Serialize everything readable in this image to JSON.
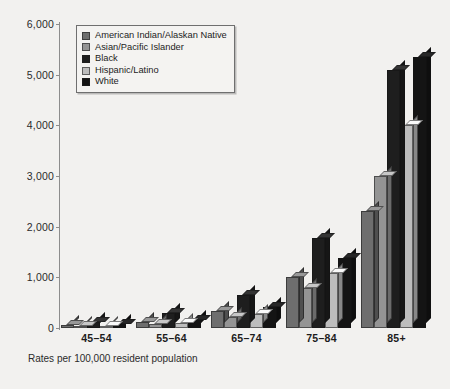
{
  "figure": {
    "background_color": "#f2f1ef",
    "footnote": "Rates per 100,000 resident population"
  },
  "legend": {
    "position": "top-left-inside",
    "entries": [
      {
        "label": "American Indian/Alaskan Native",
        "color": "#6e6e6e"
      },
      {
        "label": "Asian/Pacific Islander",
        "color": "#949494"
      },
      {
        "label": "Black",
        "color": "#1e1e1e"
      },
      {
        "label": "Hispanic/Latino",
        "color": "#bdbdbd"
      },
      {
        "label": "White",
        "color": "#141414"
      }
    ]
  },
  "axes": {
    "y_ticks": [
      "6,000",
      "5,000",
      "4,000",
      "3,000",
      "2,000",
      "1,000",
      "0"
    ],
    "x_labels": [
      "45–54",
      "55–64",
      "65–74",
      "75–84",
      "85+"
    ]
  },
  "chart_data": {
    "type": "bar",
    "title": "",
    "subtitle": "",
    "xlabel": "",
    "ylabel": "",
    "ylim": [
      0,
      6000
    ],
    "ytick_values": [
      0,
      1000,
      2000,
      3000,
      4000,
      5000,
      6000
    ],
    "grid": false,
    "legend_position": "upper left",
    "annotation": "Rates per 100,000 resident population",
    "categories": [
      "45–54",
      "55–64",
      "65–74",
      "75–84",
      "85+"
    ],
    "series": [
      {
        "name": "American Indian/Alaskan Native",
        "color": "#6e6e6e",
        "values": [
          60,
          110,
          330,
          1000,
          2300
        ]
      },
      {
        "name": "Asian/Pacific Islander",
        "color": "#949494",
        "values": [
          40,
          70,
          210,
          780,
          3000
        ]
      },
      {
        "name": "Black",
        "color": "#1e1e1e",
        "values": [
          110,
          300,
          650,
          1780,
          5100
        ]
      },
      {
        "name": "Hispanic/Latino",
        "color": "#bdbdbd",
        "values": [
          45,
          100,
          280,
          1080,
          4000
        ]
      },
      {
        "name": "White",
        "color": "#141414",
        "values": [
          70,
          165,
          420,
          1380,
          5350
        ]
      }
    ]
  }
}
